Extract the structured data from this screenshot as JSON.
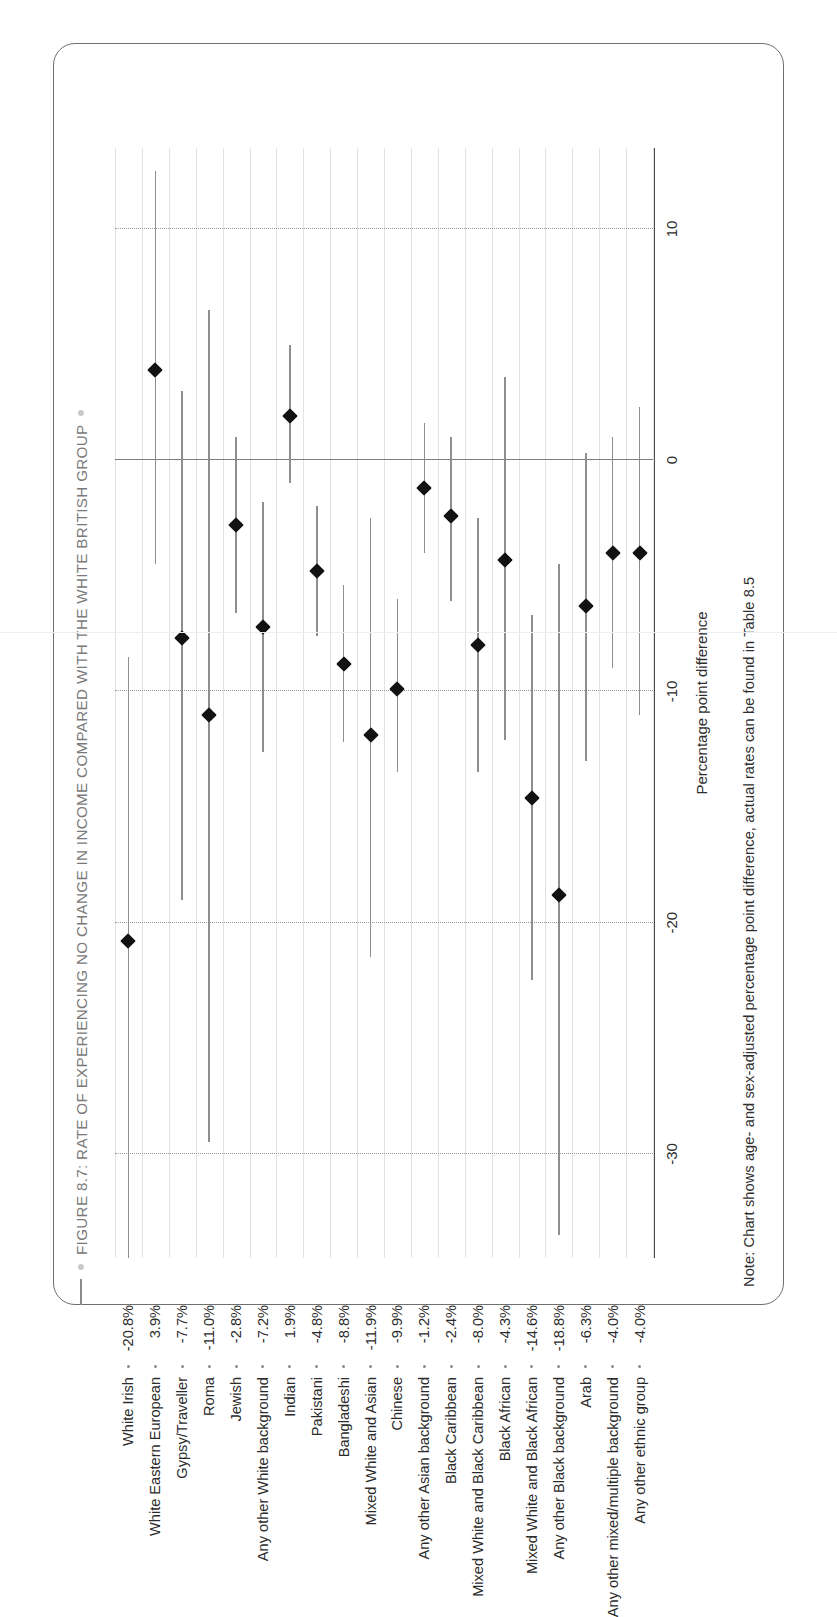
{
  "figure": {
    "title": "FIGURE 8.7: RATE OF EXPERIENCING NO CHANGE IN INCOME COMPARED WITH THE WHITE BRITISH GROUP",
    "note": "Note: Chart shows age- and sex-adjusted percentage point difference, actual rates can be found in Table 8.5",
    "title_color": "#7a7a7a",
    "marker_color": "#121212",
    "ci_color": "#8e8e8e"
  },
  "chart_data": {
    "type": "scatter",
    "orientation": "rotated-90ccw",
    "title": "FIGURE 8.7: RATE OF EXPERIENCING NO CHANGE IN INCOME COMPARED WITH THE WHITE BRITISH GROUP",
    "xlabel": "Percentage point difference",
    "ylabel": "",
    "xlim": [
      -34.5,
      13.5
    ],
    "ticks": [
      -30,
      -20,
      -10,
      0,
      10
    ],
    "tick_labels": [
      "-30",
      "-20",
      "-10",
      "0",
      "10"
    ],
    "grid": "dotted vertical gridlines at ticks; zero reference line",
    "legend": "none",
    "reference_line": 0,
    "value_suffix": "%",
    "categories": [
      "White Irish",
      "White Eastern European",
      "Gypsy/Traveller",
      "Roma",
      "Jewish",
      "Any other White background",
      "Indian",
      "Pakistani",
      "Bangladeshi",
      "Mixed White and Asian",
      "Chinese",
      "Any other Asian background",
      "Black Caribbean",
      "Mixed White and Black Caribbean",
      "Black African",
      "Mixed White and Black African",
      "Any other Black background",
      "Arab",
      "Any other mixed/multiple background",
      "Any other ethnic group"
    ],
    "value_labels": [
      "-20.8%",
      "3.9%",
      "-7.7%",
      "-11.0%",
      "-2.8%",
      "-7.2%",
      "1.9%",
      "-4.8%",
      "-8.8%",
      "-11.9%",
      "-9.9%",
      "-1.2%",
      "-2.4%",
      "-8.0%",
      "-4.3%",
      "-14.6%",
      "-18.8%",
      "-6.3%",
      "-4.0%",
      "-4.0%"
    ],
    "values": [
      -20.8,
      3.9,
      -7.7,
      -11.0,
      -2.8,
      -7.2,
      1.9,
      -4.8,
      -8.8,
      -11.9,
      -9.9,
      -1.2,
      -2.4,
      -8.0,
      -4.3,
      -14.6,
      -18.8,
      -6.3,
      -4.0,
      -4.0
    ],
    "ci_low": [
      -34.5,
      -4.5,
      -19.0,
      -29.5,
      -6.6,
      -12.6,
      -1.0,
      -7.6,
      -12.2,
      -21.5,
      -13.5,
      -4.0,
      -6.1,
      -13.5,
      -12.1,
      -22.5,
      -33.5,
      -13.0,
      -9.0,
      -11.0
    ],
    "ci_high": [
      -8.5,
      12.5,
      3.0,
      6.5,
      1.0,
      -1.8,
      5.0,
      -2.0,
      -5.4,
      -2.5,
      -6.0,
      1.6,
      1.0,
      -2.5,
      3.6,
      -6.7,
      -4.5,
      0.3,
      1.0,
      2.3
    ],
    "series_name": "Percentage point difference vs White British"
  }
}
